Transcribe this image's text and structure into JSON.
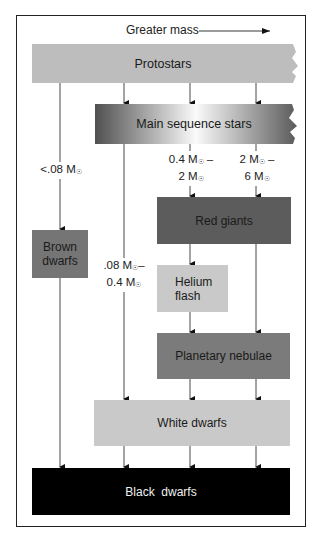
{
  "header": {
    "direction_label": "Greater mass",
    "arrow": "right-arrow"
  },
  "nodes": {
    "protostars": {
      "label": "Protostars",
      "color": "#bdbdbd"
    },
    "main_sequence": {
      "label": "Main sequence stars",
      "color_gradient": [
        "#555555",
        "#ffffff",
        "#555555"
      ]
    },
    "brown_dwarfs": {
      "label_line1": "Brown",
      "label_line2": "dwarfs",
      "color": "#757575"
    },
    "red_giants": {
      "label": "Red giants",
      "color": "#5c5c5c"
    },
    "helium_flash": {
      "label_line1": "Helium",
      "label_line2": "flash",
      "color": "#c9c9c9"
    },
    "planetary_nebulae": {
      "label": "Planetary nebulae",
      "color": "#7b7b7b"
    },
    "white_dwarfs": {
      "label": "White dwarfs",
      "color": "#c9c9c9"
    },
    "black_dwarfs": {
      "label": "Black  dwarfs",
      "color": "#000000"
    }
  },
  "mass_labels": {
    "lt_008": {
      "line1": "<.08 M",
      "sun": "☉"
    },
    "range_008_04": {
      "line1_a": ".08 M",
      "line1_b": "–",
      "line2": "0.4 M",
      "sun": "☉"
    },
    "range_04_2": {
      "line1_a": "0.4 M",
      "line1_b": " –",
      "line2": "2 M",
      "sun": "☉"
    },
    "range_2_6": {
      "line1_a": "2 M",
      "line1_b": " –",
      "line2": "6 M",
      "sun": "☉"
    }
  }
}
